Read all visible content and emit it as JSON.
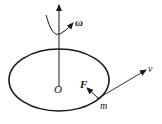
{
  "diagram": {
    "type": "physics-rotation",
    "labels": {
      "omega": "ω",
      "origin": "O",
      "force": "F",
      "velocity": "v",
      "mass": "m"
    },
    "colors": {
      "stroke": "#1a1a1a",
      "background": "#ffffff"
    }
  }
}
